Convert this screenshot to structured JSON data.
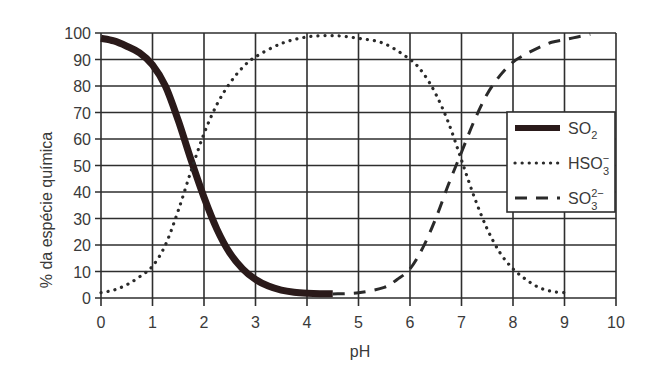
{
  "chart_data": {
    "type": "line",
    "title": "",
    "xlabel": "pH",
    "ylabel": "% da espécie química",
    "xlim": [
      0,
      10
    ],
    "ylim": [
      0,
      100
    ],
    "xticks": [
      0,
      1,
      2,
      3,
      4,
      5,
      6,
      7,
      8,
      9,
      10
    ],
    "yticks": [
      0,
      10,
      20,
      30,
      40,
      50,
      60,
      70,
      80,
      90,
      100
    ],
    "grid": true,
    "legend_position": "right-center-inside",
    "series": [
      {
        "name": "SO2",
        "label_main": "SO",
        "label_sub": "2",
        "label_sup": "",
        "style": "solid-thick",
        "x": [
          0,
          0.25,
          0.5,
          0.75,
          1.0,
          1.25,
          1.5,
          1.75,
          2.0,
          2.25,
          2.5,
          2.75,
          3.0,
          3.25,
          3.5,
          3.75,
          4.0,
          4.25,
          4.5
        ],
        "y": [
          98,
          97,
          95,
          92.5,
          88,
          80,
          67,
          52,
          38,
          26,
          17,
          11,
          7,
          4.5,
          3,
          2.2,
          1.8,
          1.6,
          1.6
        ]
      },
      {
        "name": "HSO3-",
        "label_main": "HSO",
        "label_sub": "3",
        "label_sup": "−",
        "style": "dotted",
        "x": [
          0,
          0.25,
          0.5,
          0.75,
          1.0,
          1.25,
          1.5,
          1.75,
          2.0,
          2.25,
          2.5,
          2.75,
          3.0,
          3.5,
          4.0,
          4.5,
          5.0,
          5.5,
          6.0,
          6.25,
          6.5,
          6.75,
          7.0,
          7.25,
          7.5,
          7.75,
          8.0,
          8.25,
          8.5,
          8.75,
          9.0
        ],
        "y": [
          2,
          3,
          5,
          8,
          12,
          20,
          33,
          48,
          62,
          73,
          81,
          87,
          91,
          96,
          98.5,
          99,
          98,
          96,
          90,
          85,
          77,
          66,
          52,
          38,
          26,
          17,
          11,
          7,
          4,
          2.5,
          2
        ]
      },
      {
        "name": "SO3 2-",
        "label_main": "SO",
        "label_sub": "3",
        "label_sup": "2−",
        "style": "dashed",
        "x": [
          4.5,
          5.0,
          5.5,
          5.75,
          6.0,
          6.25,
          6.5,
          6.75,
          7.0,
          7.25,
          7.5,
          7.75,
          8.0,
          8.25,
          8.5,
          8.75,
          9.0,
          9.25,
          9.5
        ],
        "y": [
          1.5,
          2,
          4,
          7,
          11,
          19,
          30,
          43,
          55,
          67,
          77,
          84,
          89,
          92,
          94.5,
          96.5,
          97.5,
          98.5,
          99.5
        ]
      }
    ]
  }
}
